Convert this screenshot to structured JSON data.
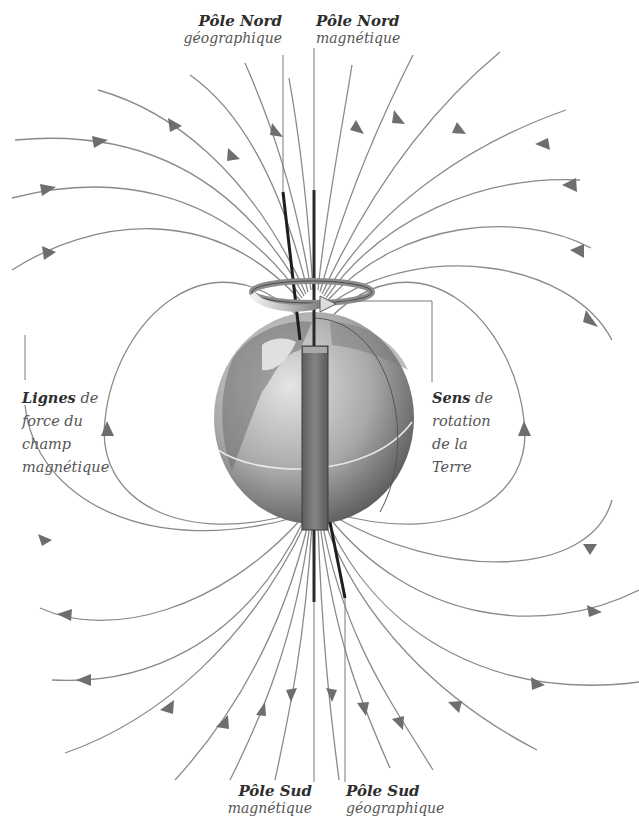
{
  "diagram": {
    "colors": {
      "field_line": "#8a8a8a",
      "arrow": "#6e6e6e",
      "axis_dark": "#1e1e1e",
      "leader": "#7a7a7a",
      "globe_light": "#c9c9c9",
      "globe_dark": "#5a5a5a",
      "magnet": "#707070",
      "ring_light": "#e6e6e6",
      "ring_dark": "#8c8c8c",
      "text": "#3a3a3a"
    },
    "labels": {
      "north_geographic": {
        "line1": "Pôle Nord",
        "line2": "géographique"
      },
      "north_magnetic": {
        "line1": "Pôle Nord",
        "line2": "magnétique"
      },
      "south_magnetic": {
        "line1": "Pôle Sud",
        "line2": "magnétique"
      },
      "south_geographic": {
        "line1": "Pôle Sud",
        "line2": "géographique"
      },
      "field_lines": {
        "keyword": "Lignes",
        "rest1": " de",
        "line2": "force du",
        "line3": "champ",
        "line4": "magnétique"
      },
      "rotation": {
        "keyword": "Sens",
        "rest1": " de",
        "line2": "rotation",
        "line3": "de la",
        "line4": "Terre"
      }
    },
    "field_lines": {
      "count_north_open": 12,
      "count_south_open": 12,
      "closed_loops": 2,
      "direction": "from south (bottom) outward, returning into north (top)"
    }
  }
}
